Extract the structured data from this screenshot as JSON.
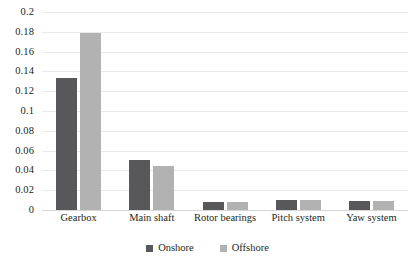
{
  "chart_data": {
    "type": "bar",
    "title": "",
    "xlabel": "",
    "ylabel": "",
    "ylim": [
      0,
      0.2
    ],
    "ytick_step": 0.02,
    "yticks": [
      "0.2",
      "0.18",
      "0.16",
      "0.14",
      "0.12",
      "0.1",
      "0.08",
      "0.06",
      "0.04",
      "0.02",
      "0"
    ],
    "grid": true,
    "legend_position": "bottom-center",
    "categories": [
      "Gearbox",
      "Main shaft",
      "Rotor bearings",
      "Pitch system",
      "Yaw system"
    ],
    "series": [
      {
        "name": "Onshore",
        "color": "#58585a",
        "values": [
          0.133,
          0.051,
          0.008,
          0.01,
          0.009
        ]
      },
      {
        "name": "Offshore",
        "color": "#b2b2b2",
        "values": [
          0.179,
          0.044,
          0.008,
          0.01,
          0.009
        ]
      }
    ]
  },
  "colors": {
    "onshore": "#58585a",
    "offshore": "#b2b2b2",
    "gridline": "#e9e9ea",
    "baseline": "#d7d7d8",
    "text": "#231f20",
    "background": "#ffffff"
  }
}
